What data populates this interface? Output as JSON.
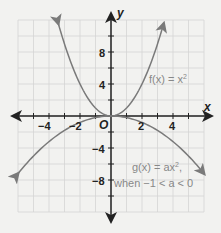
{
  "chart_data": {
    "type": "line",
    "title": "",
    "xlabel": "x",
    "ylabel": "y",
    "origin_label": "O",
    "xlim": [
      -6,
      6
    ],
    "ylim": [
      -12,
      12
    ],
    "grid": true,
    "x_gridstep": 1,
    "y_gridstep": 2,
    "x_ticks": [
      -4,
      -2,
      2,
      4
    ],
    "x_tick_labels": [
      "−4",
      "−2",
      "2",
      "4"
    ],
    "y_ticks": [
      8,
      4,
      -4,
      -8
    ],
    "y_tick_labels": [
      "8",
      "4",
      "−4",
      "−8"
    ],
    "series": [
      {
        "name": "f(x) = x²",
        "expression": "x^2",
        "color": "#7a7a7a",
        "x": [
          -3.4,
          -3,
          -2,
          -1,
          0,
          1,
          2,
          3,
          3.4
        ],
        "y": [
          11.56,
          9,
          4,
          1,
          0,
          1,
          4,
          9,
          11.56
        ]
      },
      {
        "name": "g(x) = ax², when −1 < a < 0",
        "expression": "a*x^2, a≈-0.2",
        "color": "#7a7a7a",
        "x": [
          -6,
          -4,
          -2,
          0,
          2,
          4,
          6
        ],
        "y": [
          -7.2,
          -3.2,
          -0.8,
          0,
          -0.8,
          -3.2,
          -7.2
        ]
      }
    ],
    "annotations": [
      {
        "text": "f(x) = x²",
        "x": 4.2,
        "y": 5
      },
      {
        "text": "g(x) = ax²,",
        "x": 4.1,
        "y": -6.5
      },
      {
        "text": "when −1 < a < 0",
        "x": 3,
        "y": -9
      }
    ]
  },
  "labels": {
    "x_axis": "x",
    "y_axis": "y",
    "origin": "O",
    "f_label_main": "f(x) = x",
    "f_label_exp": "2",
    "g_label_main": "g(x) = ax",
    "g_label_exp": "2",
    "g_label_comma": ",",
    "g_condition": "when −1 < a < 0",
    "xt_m4": "−4",
    "xt_m2": "−2",
    "xt_2": "2",
    "xt_4": "4",
    "yt_8": "8",
    "yt_4": "4",
    "yt_m4": "−4",
    "yt_m8": "−8"
  }
}
